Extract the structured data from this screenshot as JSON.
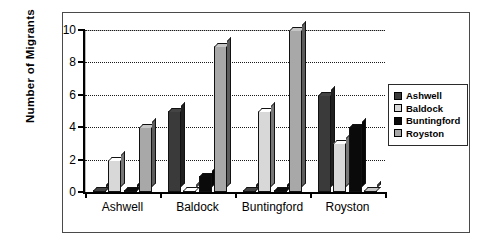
{
  "chart_data": {
    "type": "bar",
    "title": "",
    "subtitle": "",
    "xlabel": "",
    "ylabel": "Number of Migrants",
    "ylim": [
      0,
      10
    ],
    "ytick_labels": [
      "0",
      "2",
      "4",
      "6",
      "8",
      "10"
    ],
    "ytick_values": [
      0,
      2,
      4,
      6,
      8,
      10
    ],
    "grid": true,
    "grid_axis": "y",
    "legend_position": "right",
    "categories": [
      "Ashwell",
      "Baldock",
      "Buntingford",
      "Royston"
    ],
    "series": [
      {
        "name": "Ashwell",
        "color": "#3a3a3a",
        "values": [
          0,
          5,
          0,
          6
        ]
      },
      {
        "name": "Baldock",
        "color": "#d8d8d8",
        "values": [
          2,
          0,
          5,
          3
        ]
      },
      {
        "name": "Buntingford",
        "color": "#0a0a0a",
        "values": [
          0,
          1,
          0,
          4
        ]
      },
      {
        "name": "Royston",
        "color": "#a8a8a8",
        "values": [
          4,
          9,
          10,
          0
        ]
      }
    ]
  },
  "legend": {
    "items": [
      {
        "label": "Ashwell"
      },
      {
        "label": "Baldock"
      },
      {
        "label": "Buntingford"
      },
      {
        "label": "Royston"
      }
    ]
  },
  "axes": {
    "y_title": "Number of Migrants"
  }
}
